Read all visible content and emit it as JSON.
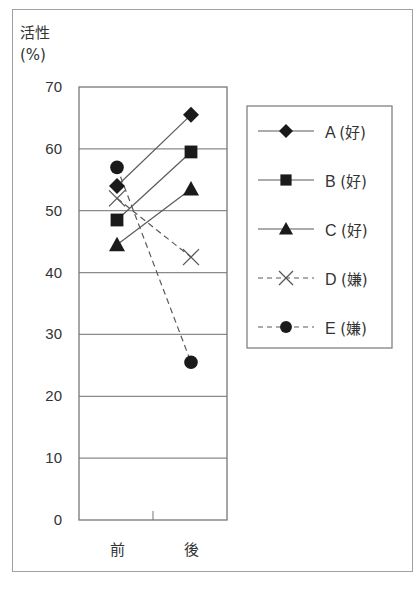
{
  "chart_data": {
    "type": "line",
    "title": "",
    "ylabel_line1": "活性",
    "ylabel_line2": "(%)",
    "xlabel": "",
    "categories": [
      "前",
      "後"
    ],
    "ylim": [
      0,
      70
    ],
    "yticks": [
      "70",
      "60",
      "50",
      "40",
      "30",
      "20",
      "10",
      "0"
    ],
    "grid": true,
    "legend_position": "right",
    "series": [
      {
        "name": "A",
        "tag": "(好)",
        "marker": "diamond",
        "line": "solid",
        "values": [
          54,
          65.5
        ]
      },
      {
        "name": "B",
        "tag": "(好)",
        "marker": "square",
        "line": "solid",
        "values": [
          48.5,
          59.5
        ]
      },
      {
        "name": "C",
        "tag": "(好)",
        "marker": "triangle",
        "line": "solid",
        "values": [
          44.5,
          53.5
        ]
      },
      {
        "name": "D",
        "tag": "(嫌)",
        "marker": "x",
        "line": "dashed",
        "values": [
          52,
          42.5
        ]
      },
      {
        "name": "E",
        "tag": "(嫌)",
        "marker": "circle",
        "line": "dashed",
        "values": [
          57,
          25.5
        ]
      }
    ]
  },
  "colors": {
    "frame": "#a0a0a0",
    "axis": "#777777",
    "grid": "#8a8a8a",
    "line": "#5a5a5a",
    "marker": "#1a1a1a",
    "text": "#333333"
  },
  "legend": {
    "items": [
      {
        "label": "A",
        "tag": "(好)"
      },
      {
        "label": "B",
        "tag": "(好)"
      },
      {
        "label": "C",
        "tag": "(好)"
      },
      {
        "label": "D",
        "tag": "(嫌)"
      },
      {
        "label": "E",
        "tag": "(嫌)"
      }
    ]
  }
}
